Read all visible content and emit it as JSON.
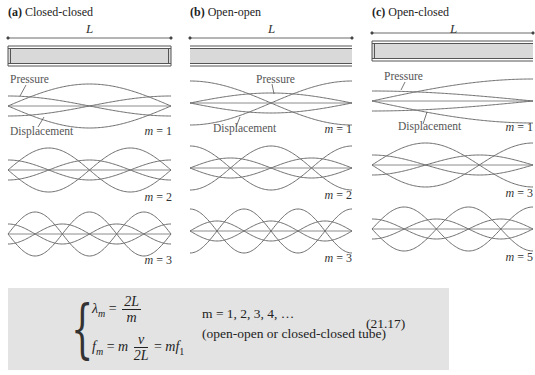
{
  "panels": [
    {
      "id": "a",
      "letter": "(a)",
      "title": "Closed-closed",
      "length_label": "L",
      "tube": {
        "left_closed": true,
        "right_closed": true
      },
      "modes": [
        {
          "m_label": "m",
          "m_eq": " = 1",
          "m": 1
        },
        {
          "m_label": "m",
          "m_eq": " = 2",
          "m": 2
        },
        {
          "m_label": "m",
          "m_eq": " = 3",
          "m": 3
        }
      ],
      "wave_labels": {
        "pressure": "Pressure",
        "displacement": "Displacement"
      }
    },
    {
      "id": "b",
      "letter": "(b)",
      "title": "Open-open",
      "length_label": "L",
      "tube": {
        "left_closed": false,
        "right_closed": false
      },
      "modes": [
        {
          "m_label": "m",
          "m_eq": " = 1",
          "m": 1
        },
        {
          "m_label": "m",
          "m_eq": " = 2",
          "m": 2
        },
        {
          "m_label": "m",
          "m_eq": " = 3",
          "m": 3
        }
      ],
      "wave_labels": {
        "pressure": "Pressure",
        "displacement": "Displacement"
      }
    },
    {
      "id": "c",
      "letter": "(c)",
      "title": "Open-closed",
      "length_label": "L",
      "tube": {
        "left_closed": true,
        "right_closed": false
      },
      "modes": [
        {
          "m_label": "m",
          "m_eq": " = 1",
          "m": 1
        },
        {
          "m_label": "m",
          "m_eq": " = 3",
          "m": 3
        },
        {
          "m_label": "m",
          "m_eq": " = 5",
          "m": 5
        }
      ],
      "wave_labels": {
        "pressure": "Pressure",
        "displacement": "Displacement"
      }
    }
  ],
  "formula": {
    "lambda_lhs": "λ",
    "lambda_sub": "m",
    "lambda_num": "2L",
    "lambda_den": "m",
    "f_lhs": "f",
    "f_sub": "m",
    "f_mid": "m",
    "f_num": "v",
    "f_den": "2L",
    "f_rhs_m": "mf",
    "f_rhs_sub": "1",
    "condition_values": "m = 1, 2, 3, 4, …",
    "condition_note": "(open-open or closed-closed tube)",
    "equation_number": "(21.17)",
    "box_color": "#e3e3e3"
  },
  "colors": {
    "curve": "#6e6e6e",
    "tube_fill": "#d9d9d9",
    "tube_wall": "#555555"
  }
}
